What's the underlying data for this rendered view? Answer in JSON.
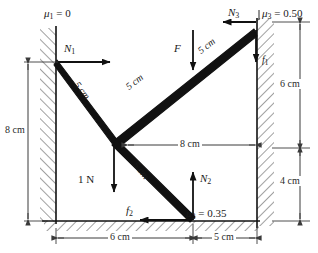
{
  "figure": {
    "friction_labels": [
      {
        "id": "mu1",
        "mu": "μ",
        "sub": "1",
        "text": " = 0",
        "full": "μ₁ = 0",
        "x": 44,
        "y": 8
      },
      {
        "id": "mu3",
        "mu": "μ",
        "sub": "3",
        "text": " = 0.50",
        "full": "μ₃ = 0.50",
        "x": 262,
        "y": 8
      },
      {
        "id": "mu2",
        "mu": "μ",
        "sub": "2",
        "text": " = 0.35",
        "full": "μ₂ = 0.35",
        "x": 186,
        "y": 208
      }
    ],
    "force_labels": [
      {
        "id": "N1",
        "sym": "N",
        "sub": "1",
        "full": "N₁",
        "x": 64,
        "y": 43
      },
      {
        "id": "N3",
        "sym": "N",
        "sub": "3",
        "full": "N₃",
        "x": 228,
        "y": 8
      },
      {
        "id": "N2",
        "sym": "N",
        "sub": "2",
        "full": "N₂",
        "x": 200,
        "y": 174
      },
      {
        "id": "f1",
        "sym": "f",
        "sub": "1",
        "full": "f₁",
        "x": 262,
        "y": 57
      },
      {
        "id": "f2",
        "sym": "f",
        "sub": "2",
        "full": "f₂",
        "x": 126,
        "y": 206
      },
      {
        "id": "F",
        "sym": "F",
        "sub": "",
        "full": "F",
        "x": 174,
        "y": 44
      },
      {
        "id": "load",
        "sym": "1 N",
        "sub": "",
        "full": "1 N",
        "x": 80,
        "y": 175
      }
    ],
    "member_labels": [
      {
        "id": "len-upper-left",
        "text": "5 cm",
        "x": 84,
        "y": 84,
        "rot": 52
      },
      {
        "id": "len-lower-left",
        "text": "5 cm",
        "x": 141,
        "y": 165,
        "rot": 52
      },
      {
        "id": "len-mid",
        "text": "5 cm",
        "x": 150,
        "y": 72,
        "rot": -21
      },
      {
        "id": "len-upper-right",
        "text": "5 cm",
        "x": 214,
        "y": 34,
        "rot": -37
      }
    ],
    "dimensions": [
      {
        "id": "dim-left-8cm",
        "text": "8 cm",
        "x": 8,
        "y": 130,
        "orient": "vertical"
      },
      {
        "id": "dim-right-6cm",
        "text": "6 cm",
        "x": 279,
        "y": 85,
        "orient": "vertical"
      },
      {
        "id": "dim-right-4cm",
        "text": "4 cm",
        "x": 279,
        "y": 181,
        "orient": "vertical"
      },
      {
        "id": "dim-mid-8cm",
        "text": "8 cm",
        "x": 194,
        "y": 139,
        "orient": "horizontal"
      },
      {
        "id": "dim-bottom-6cm",
        "text": "6 cm",
        "x": 120,
        "y": 237,
        "orient": "horizontal"
      },
      {
        "id": "dim-bottom-5cm",
        "text": "5 cm",
        "x": 214,
        "y": 237,
        "orient": "horizontal"
      }
    ],
    "colors": {
      "ink": "#111111",
      "dim": "#3a3a3a",
      "hatch": "#4a4a4a",
      "background": "#ffffff"
    }
  }
}
